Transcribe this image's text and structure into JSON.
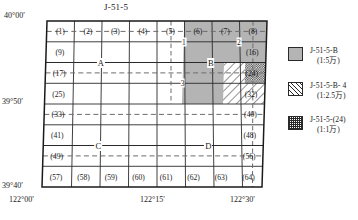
{
  "map": {
    "sheet_title": "J-51-5",
    "corner_labels": {
      "top_left_lat": "40°00′",
      "bottom_left_lat": "39°40′",
      "mid_left_lat": "39°50′",
      "bottom_lon_left": "122°00′",
      "bottom_lon_mid": "122°15′",
      "bottom_lon_right": "122°30′"
    },
    "grid": {
      "cols": 8,
      "rows": 8,
      "cell_numbers": [
        [
          "(1)",
          "(2)",
          "(3)",
          "(4)",
          "(5)",
          "(6)",
          "(7)",
          "(8)"
        ],
        [
          "(9)",
          "",
          "",
          "",
          "",
          "",
          "",
          "(16)"
        ],
        [
          "(17)",
          "",
          "",
          "",
          "",
          "",
          "",
          "(24)"
        ],
        [
          "(25)",
          "",
          "",
          "",
          "",
          "",
          "",
          "(32)"
        ],
        [
          "(33)",
          "",
          "",
          "",
          "",
          "",
          "",
          "(40)"
        ],
        [
          "(41)",
          "",
          "",
          "",
          "",
          "",
          "",
          "(48)"
        ],
        [
          "(49)",
          "",
          "",
          "",
          "",
          "",
          "",
          "(56)"
        ],
        [
          "(57)",
          "(58)",
          "(59)",
          "(60)",
          "(61)",
          "(62)",
          "(63)",
          "(64)"
        ]
      ]
    },
    "node_labels": [
      {
        "text": "A",
        "col": 2,
        "row": 2
      },
      {
        "text": "B",
        "col": 6,
        "row": 2
      },
      {
        "text": "C",
        "col": 2,
        "row": 6
      },
      {
        "text": "D",
        "col": 6,
        "row": 6
      }
    ],
    "sub_labels": [
      {
        "text": "1",
        "col": 5,
        "row": 1
      },
      {
        "text": "2",
        "col": 7,
        "row": 1
      },
      {
        "text": "3",
        "col": 5,
        "row": 3
      }
    ],
    "regions": {
      "gray": {
        "col_start": 5,
        "col_end": 8,
        "row_start": 1,
        "row_end": 4
      },
      "hatch": {
        "col_start": 7,
        "col_end": 8,
        "row_start": 3,
        "row_end": 4
      },
      "check": {
        "col_start": 8,
        "col_end": 8,
        "row_start": 3,
        "row_end": 3
      }
    }
  },
  "legend": {
    "items": [
      {
        "swatch": "gray-swatch",
        "code": "J-51-5-B",
        "scale": "(1:5万)"
      },
      {
        "swatch": "hatch-swatch",
        "code": "J-51-5-B- 4",
        "scale": "(1:2.5万)"
      },
      {
        "swatch": "check-swatch",
        "code": "J-51-5-(24)",
        "scale": "(1:1万)"
      }
    ]
  },
  "colors": {
    "gray_fill": "#b4b4b4",
    "line": "#2a2a2a",
    "background": "#ffffff"
  }
}
